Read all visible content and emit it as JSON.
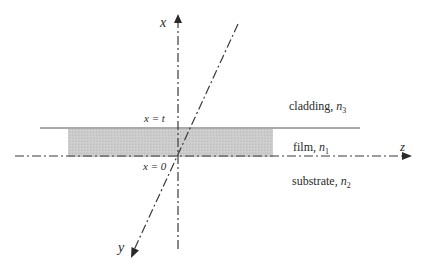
{
  "diagram": {
    "axes": {
      "x_label": "x",
      "y_label": "y",
      "z_label": "z"
    },
    "boundaries": {
      "top": "x = t",
      "bottom": "x = 0"
    },
    "regions": {
      "cladding": {
        "name": "cladding, ",
        "index_symbol": "n",
        "index_sub": "3"
      },
      "film": {
        "name": "film, ",
        "index_symbol": "n",
        "index_sub": "1"
      },
      "substrate": {
        "name": "substrate, ",
        "index_symbol": "n",
        "index_sub": "2"
      }
    },
    "colors": {
      "line": "#3a3a3a",
      "film_fill": "#c9c9c9",
      "text": "#2a2a2a"
    }
  }
}
